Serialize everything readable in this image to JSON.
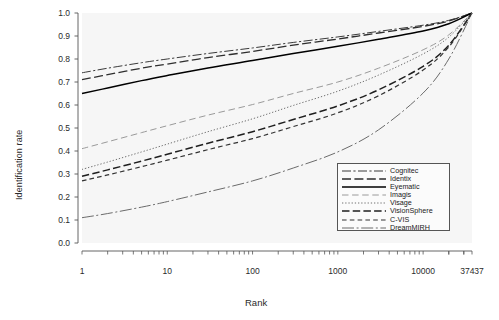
{
  "chart_data": {
    "type": "line",
    "title": "",
    "xlabel": "Rank",
    "ylabel": "Identification rate",
    "xscale": "log",
    "xlim": [
      1,
      37437
    ],
    "ylim": [
      0.0,
      1.0
    ],
    "grid": false,
    "legend_position": "lower-right",
    "xticks": [
      1,
      10,
      100,
      1000,
      10000,
      37437
    ],
    "xtick_labels": [
      "1",
      "10",
      "100",
      "1000",
      "10000",
      "37437"
    ],
    "yticks": [
      0.0,
      0.1,
      0.2,
      0.3,
      0.4,
      0.5,
      0.6,
      0.7,
      0.8,
      0.9,
      1.0
    ],
    "ytick_labels": [
      "0.0",
      "0.1",
      "0.2",
      "0.3",
      "0.4",
      "0.5",
      "0.6",
      "0.7",
      "0.8",
      "0.9",
      "1.0"
    ],
    "x": [
      1,
      2,
      5,
      10,
      30,
      100,
      300,
      1000,
      3000,
      10000,
      20000,
      37437
    ],
    "series": [
      {
        "name": "Cognitec",
        "dash": "dashdot",
        "color": "#3a3a3a",
        "values": [
          0.74,
          0.76,
          0.784,
          0.8,
          0.824,
          0.848,
          0.872,
          0.896,
          0.92,
          0.947,
          0.968,
          1.0
        ]
      },
      {
        "name": "Identix",
        "dash": "longdash",
        "color": "#2e2e2e",
        "values": [
          0.71,
          0.732,
          0.76,
          0.778,
          0.806,
          0.833,
          0.86,
          0.887,
          0.913,
          0.942,
          0.965,
          1.0
        ]
      },
      {
        "name": "Eyematic",
        "dash": "solid",
        "color": "#000000",
        "values": [
          0.65,
          0.674,
          0.706,
          0.728,
          0.761,
          0.793,
          0.824,
          0.855,
          0.886,
          0.922,
          0.953,
          1.0
        ]
      },
      {
        "name": "Imagis",
        "dash": "dashed-light",
        "color": "#9a9a9a",
        "values": [
          0.41,
          0.44,
          0.48,
          0.51,
          0.556,
          0.602,
          0.65,
          0.7,
          0.76,
          0.84,
          0.905,
          1.0
        ]
      },
      {
        "name": "Visage",
        "dash": "dotted",
        "color": "#707070",
        "values": [
          0.32,
          0.352,
          0.396,
          0.43,
          0.484,
          0.54,
          0.598,
          0.66,
          0.73,
          0.822,
          0.895,
          1.0
        ]
      },
      {
        "name": "VisionSphere",
        "dash": "dash-heavy",
        "color": "#1f1f1f",
        "values": [
          0.29,
          0.318,
          0.356,
          0.386,
          0.434,
          0.484,
          0.537,
          0.596,
          0.666,
          0.768,
          0.86,
          1.0
        ]
      },
      {
        "name": "C-VIS",
        "dash": "dash-short",
        "color": "#333333",
        "values": [
          0.27,
          0.296,
          0.332,
          0.36,
          0.406,
          0.454,
          0.506,
          0.566,
          0.64,
          0.752,
          0.852,
          1.0
        ]
      },
      {
        "name": "DreamMIRH",
        "dash": "dashdot-long",
        "color": "#6b6b6b",
        "values": [
          0.11,
          0.128,
          0.156,
          0.18,
          0.222,
          0.27,
          0.326,
          0.396,
          0.492,
          0.652,
          0.8,
          1.0
        ]
      }
    ]
  }
}
